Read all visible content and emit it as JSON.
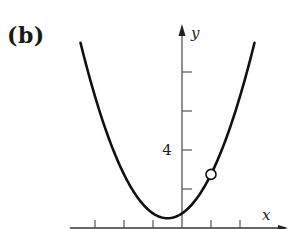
{
  "figure": {
    "panel_label": "(b)"
  },
  "chart_data": {
    "type": "line",
    "title": "",
    "panel_label": "(b)",
    "xlabel": "x",
    "ylabel": "y",
    "y_tick_labels": [
      {
        "value": 4,
        "label": "4"
      }
    ],
    "y_ticks": [
      2,
      4,
      6,
      8
    ],
    "x_ticks": [
      -3,
      -2,
      -1,
      1,
      2
    ],
    "xlim": [
      -3.8,
      3.0
    ],
    "ylim": [
      0,
      11
    ],
    "grid": false,
    "legend": null,
    "series": [
      {
        "name": "parabola",
        "description": "Parabola opening upward with vertex near (-0.5, 0.5)",
        "x": [
          -3.5,
          -3,
          -2.5,
          -2,
          -1.5,
          -1,
          -0.5,
          0,
          0.5,
          1,
          1.5,
          2,
          2.5
        ],
        "y": [
          9.5,
          6.75,
          4.5,
          2.75,
          1.5,
          0.75,
          0.5,
          0.75,
          1.5,
          2.75,
          4.5,
          6.75,
          9.5
        ]
      }
    ],
    "annotations": [
      {
        "type": "open_circle",
        "x": 1,
        "y": 2.75,
        "description": "hole / removable discontinuity"
      }
    ]
  }
}
